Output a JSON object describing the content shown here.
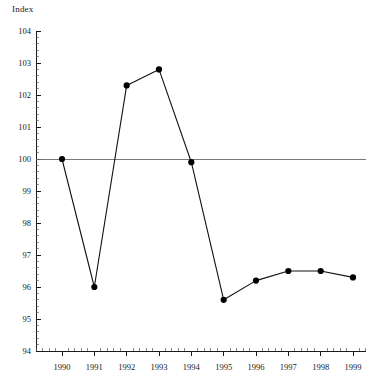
{
  "chart_data": {
    "type": "line",
    "title": "",
    "subtitle": "",
    "xlabel": "",
    "ylabel": "Index",
    "categories": [
      "1990",
      "1991",
      "1992",
      "1993",
      "1994",
      "1995",
      "1996",
      "1997",
      "1998",
      "1999"
    ],
    "x": [
      1990,
      1991,
      1992,
      1993,
      1994,
      1995,
      1996,
      1997,
      1998,
      1999
    ],
    "values": [
      100.0,
      96.0,
      102.3,
      102.8,
      99.9,
      95.6,
      96.2,
      96.5,
      96.5,
      96.3
    ],
    "series": [
      {
        "name": "Index",
        "values": [
          100.0,
          96.0,
          102.3,
          102.8,
          99.9,
          95.6,
          96.2,
          96.5,
          96.5,
          96.3
        ]
      }
    ],
    "ylim": [
      94,
      104
    ],
    "xlim": [
      1989.6,
      1999.6
    ],
    "y_ticks": [
      94,
      95,
      96,
      97,
      98,
      99,
      100,
      101,
      102,
      103,
      104
    ],
    "y_tick_labels": [
      "94",
      "95",
      "96",
      "97",
      "98",
      "99",
      "100",
      "101",
      "102",
      "103",
      "104"
    ],
    "y_minor_tick_step": 0.2,
    "x_tick_labels": [
      "1990",
      "1991",
      "1992",
      "1993",
      "1994",
      "1995",
      "1996",
      "1997",
      "1998",
      "1999"
    ],
    "x_minor_ticks_per_interval": 4,
    "reference_line": {
      "value": 100,
      "label": "",
      "color": "#6b6b6b"
    },
    "grid": false,
    "legend": null,
    "legend_position": "none",
    "marker": "filled-circle",
    "line_color": "#111111",
    "marker_color": "#000000",
    "background_color": "#ffffff",
    "annotations": []
  },
  "labels": {
    "y_axis_caption": "Index"
  }
}
